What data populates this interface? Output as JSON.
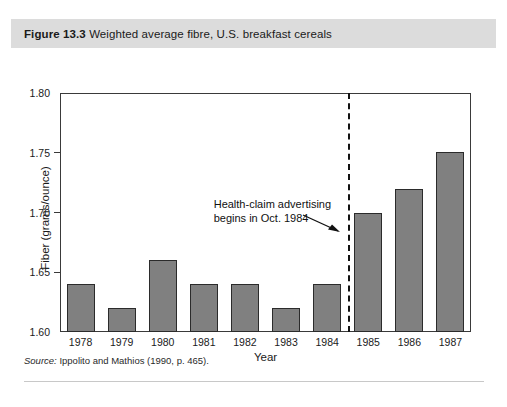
{
  "figure": {
    "label": "Figure 13.3",
    "title": "Weighted average fibre, U.S. breakfast cereals",
    "source_label": "Source:",
    "source_text": " Ippolito and Mathios (1990, p. 465)."
  },
  "colors": {
    "title_bar_background": "#dcdcdc",
    "bar_fill": "#808080",
    "bar_border": "#2b2b2b",
    "axis": "#3a3a3a",
    "event_line": "#111111",
    "page_background": "#ffffff"
  },
  "chart_data": {
    "type": "bar",
    "title": "Weighted average fibre, U.S. breakfast cereals",
    "xlabel": "Year",
    "ylabel": "Fiber (grams/ounce)",
    "categories": [
      "1978",
      "1979",
      "1980",
      "1981",
      "1982",
      "1983",
      "1984",
      "1985",
      "1986",
      "1987"
    ],
    "values": [
      1.64,
      1.62,
      1.66,
      1.64,
      1.64,
      1.62,
      1.64,
      1.7,
      1.72,
      1.751
    ],
    "ylim": [
      1.6,
      1.8
    ],
    "ytick_labels": [
      "1.80",
      "1.75",
      "1.70",
      "1.65",
      "1.60"
    ],
    "ytick_values": [
      1.8,
      1.75,
      1.7,
      1.65,
      1.6
    ],
    "grid": false,
    "legend": "none",
    "annotations": [
      {
        "text_line_1": "Health-claim advertising",
        "text_line_2": "begins in Oct. 1984",
        "marker": "dashed-vertical-line",
        "at_x": "between 1984 and 1985"
      }
    ]
  }
}
